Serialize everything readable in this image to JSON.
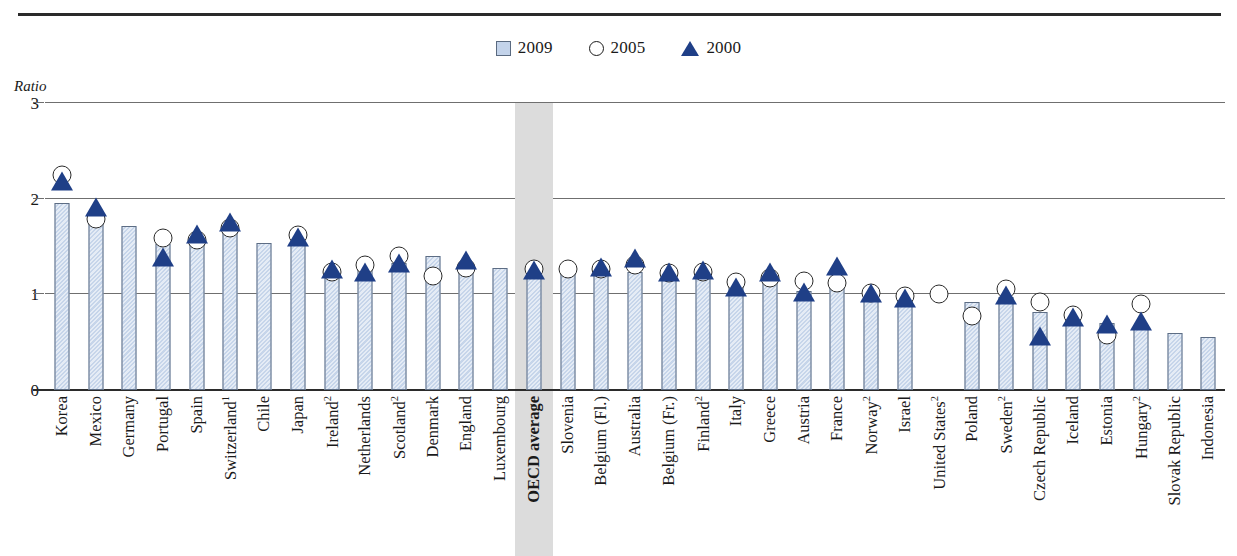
{
  "figure": {
    "axis_title": "Ratio",
    "accent_bar": "#c6d5ea",
    "accent_triangle": "#1f3f87",
    "highlight_band": "#dcdcdc"
  },
  "legend": {
    "position": "top-center",
    "items": [
      {
        "label": "2009",
        "marker": "square-swatch"
      },
      {
        "label": "2005",
        "marker": "circle-outline"
      },
      {
        "label": "2000",
        "marker": "triangle-filled"
      }
    ]
  },
  "y_axis": {
    "label": "Ratio",
    "ticks": [
      "0",
      "1",
      "2",
      "3"
    ],
    "min": 0,
    "max": 3
  },
  "chart_data": {
    "type": "bar",
    "title": "",
    "xlabel": "",
    "ylabel": "Ratio",
    "ylim": [
      0,
      3
    ],
    "yticks": [
      0,
      1,
      2,
      3
    ],
    "grid": true,
    "legend_position": "top-center",
    "highlight_category": "OECD average",
    "categories": [
      "Korea",
      "Mexico",
      "Germany",
      "Portugal",
      "Spain",
      "Switzerland¹",
      "Chile",
      "Japan",
      "Ireland²",
      "Netherlands",
      "Scotland²",
      "Denmark",
      "England",
      "Luxembourg",
      "OECD average",
      "Slovenia",
      "Belgium (Fl.)",
      "Australia",
      "Belgium (Fr.)",
      "Finland²",
      "Italy",
      "Greece",
      "Austria",
      "France",
      "Norway²",
      "Israel",
      "United States²",
      "Poland",
      "Sweden²",
      "Czech Republic",
      "Iceland",
      "Estonia",
      "Hungary²",
      "Slovak Republic",
      "Indonesia"
    ],
    "category_footnotes": {
      "Switzerland¹": 1,
      "Ireland²": 2,
      "Scotland²": 2,
      "Finland²": 2,
      "Norway²": 2,
      "United States²": 2,
      "Sweden²": 2,
      "Hungary²": 2
    },
    "series": [
      {
        "name": "2009",
        "type": "bar",
        "values": [
          1.96,
          1.84,
          1.71,
          1.53,
          1.56,
          1.65,
          1.54,
          1.52,
          1.27,
          1.28,
          1.33,
          1.4,
          1.3,
          1.28,
          1.26,
          1.25,
          1.23,
          1.23,
          1.21,
          1.21,
          1.1,
          1.18,
          1.03,
          1.11,
          1.0,
          0.97,
          null,
          0.92,
          0.97,
          0.82,
          0.77,
          0.7,
          0.68,
          0.6,
          0.55
        ]
      },
      {
        "name": "2005",
        "type": "scatter-circle",
        "values": [
          2.25,
          1.79,
          null,
          1.59,
          1.57,
          1.69,
          null,
          1.62,
          1.23,
          1.31,
          1.4,
          1.19,
          1.28,
          null,
          1.26,
          1.27,
          1.26,
          1.31,
          1.22,
          1.23,
          1.13,
          1.17,
          1.14,
          1.12,
          1.01,
          0.98,
          1.0,
          0.77,
          1.06,
          0.92,
          0.78,
          0.57,
          0.9,
          null,
          null
        ]
      },
      {
        "name": "2000",
        "type": "scatter-triangle",
        "values": [
          2.18,
          1.91,
          null,
          1.39,
          1.63,
          1.76,
          null,
          1.6,
          1.26,
          1.23,
          1.33,
          null,
          1.36,
          null,
          1.25,
          null,
          1.29,
          1.38,
          1.23,
          1.25,
          1.08,
          1.23,
          1.02,
          1.3,
          1.01,
          0.96,
          null,
          null,
          0.99,
          0.56,
          0.76,
          0.69,
          0.72,
          null,
          null
        ]
      }
    ]
  }
}
